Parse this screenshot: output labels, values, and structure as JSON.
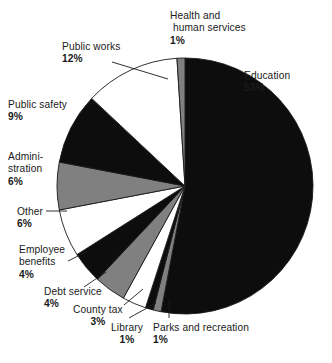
{
  "chart_data": {
    "type": "pie",
    "title": "",
    "subtitle": "",
    "xlabel": "",
    "ylabel": "",
    "legend_position": "none",
    "grid": false,
    "units": "percent",
    "start_angle_deg": 0,
    "direction": "clockwise",
    "center": {
      "x": 185,
      "y": 186
    },
    "radius": 128,
    "categories": [
      "Education",
      "Parks and recreation",
      "Library",
      "County tax",
      "Debt service",
      "Employee benefits",
      "Other",
      "Administration",
      "Public safety",
      "Public works",
      "Health and human services"
    ],
    "values": [
      53,
      1,
      1,
      3,
      4,
      4,
      6,
      6,
      9,
      12,
      1
    ],
    "slices": [
      {
        "label": "Education",
        "label_lines": [
          "Education"
        ],
        "percent_text": "53%",
        "value": 53,
        "color": "#0d0d0d",
        "fill_name": "black",
        "leader_line": false,
        "label_align": "left"
      },
      {
        "label": "Parks and recreation",
        "label_lines": [
          "Parks and recreation"
        ],
        "percent_text": "1%",
        "value": 1,
        "color": "#808080",
        "fill_name": "gray",
        "leader_line": true,
        "label_align": "left"
      },
      {
        "label": "Library",
        "label_lines": [
          "Library"
        ],
        "percent_text": "1%",
        "value": 1,
        "color": "#0d0d0d",
        "fill_name": "black",
        "leader_line": true,
        "label_align": "center"
      },
      {
        "label": "County tax",
        "label_lines": [
          "County tax"
        ],
        "percent_text": "3%",
        "value": 3,
        "color": "#ffffff",
        "fill_name": "white",
        "leader_line": true,
        "label_align": "center"
      },
      {
        "label": "Debt service",
        "label_lines": [
          "Debt service"
        ],
        "percent_text": "4%",
        "value": 4,
        "color": "#808080",
        "fill_name": "gray",
        "leader_line": true,
        "label_align": "left"
      },
      {
        "label": "Employee benefits",
        "label_lines": [
          "Employee",
          "benefits"
        ],
        "percent_text": "4%",
        "value": 4,
        "color": "#0d0d0d",
        "fill_name": "black",
        "leader_line": true,
        "label_align": "left"
      },
      {
        "label": "Other",
        "label_lines": [
          "Other"
        ],
        "percent_text": "6%",
        "value": 6,
        "color": "#ffffff",
        "fill_name": "white",
        "leader_line": true,
        "label_align": "left"
      },
      {
        "label": "Administration",
        "label_lines": [
          "Admini-",
          "stration"
        ],
        "percent_text": "6%",
        "value": 6,
        "color": "#808080",
        "fill_name": "gray",
        "leader_line": false,
        "label_align": "left"
      },
      {
        "label": "Public safety",
        "label_lines": [
          "Public safety"
        ],
        "percent_text": "9%",
        "value": 9,
        "color": "#0d0d0d",
        "fill_name": "black",
        "leader_line": false,
        "label_align": "left"
      },
      {
        "label": "Public works",
        "label_lines": [
          "Public works"
        ],
        "percent_text": "12%",
        "value": 12,
        "color": "#ffffff",
        "fill_name": "white",
        "leader_line": true,
        "label_align": "left"
      },
      {
        "label": "Health and human services",
        "label_lines": [
          "Health and",
          "human services"
        ],
        "percent_text": "1%",
        "value": 1,
        "color": "#808080",
        "fill_name": "gray",
        "leader_line": false,
        "label_align": "left"
      }
    ],
    "palette": {
      "black": "#0d0d0d",
      "gray": "#808080",
      "white": "#ffffff",
      "outline": "#1a1a1a",
      "background": "#ffffff",
      "text": "#1a1a1a"
    }
  },
  "labels": {
    "education": {
      "line1": "Education",
      "pct": "53%"
    },
    "parks": {
      "line1": "Parks and recreation",
      "pct": "1%"
    },
    "library": {
      "line1": "Library",
      "pct": "1%"
    },
    "county_tax": {
      "line1": "County tax",
      "pct": "3%"
    },
    "debt": {
      "line1": "Debt service",
      "pct": "4%"
    },
    "employee": {
      "line1": "Employee",
      "line2": "benefits",
      "pct": "4%"
    },
    "other": {
      "line1": "Other",
      "pct": "6%"
    },
    "admin": {
      "line1": "Admini-",
      "line2": "stration",
      "pct": "6%"
    },
    "safety": {
      "line1": "Public safety",
      "pct": "9%"
    },
    "works": {
      "line1": "Public works",
      "pct": "12%"
    },
    "health": {
      "line1": "Health and",
      "line2": "human services",
      "pct": "1%"
    }
  }
}
